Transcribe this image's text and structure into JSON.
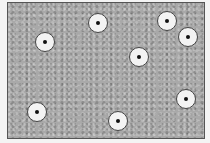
{
  "field": {
    "fill_color": "#a9a9a9",
    "border_color": "#555555",
    "texture": "gravel"
  },
  "markers": [
    {
      "x": 45,
      "y": 42
    },
    {
      "x": 98,
      "y": 23
    },
    {
      "x": 167,
      "y": 21
    },
    {
      "x": 188,
      "y": 37
    },
    {
      "x": 139,
      "y": 57
    },
    {
      "x": 37,
      "y": 112
    },
    {
      "x": 118,
      "y": 121
    },
    {
      "x": 186,
      "y": 99
    }
  ],
  "marker_style": {
    "diameter": 20,
    "fill": "#f3f3f3",
    "ring": "#444444",
    "center_dot": "#111111"
  }
}
